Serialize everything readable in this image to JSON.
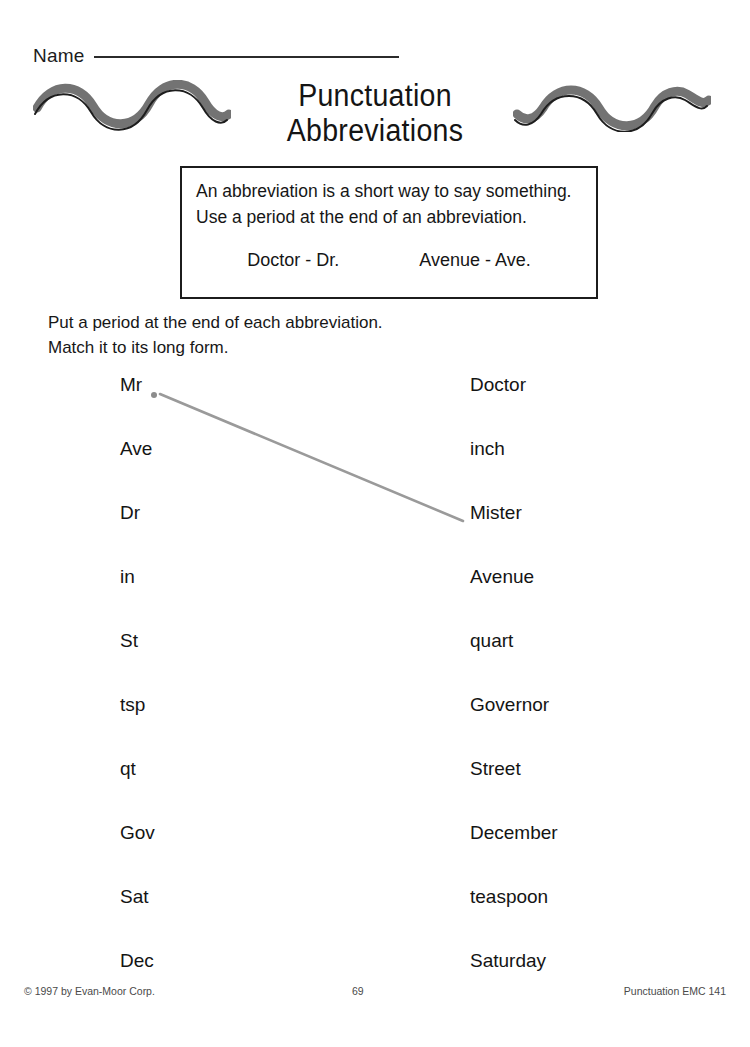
{
  "worksheet": {
    "name_label": "Name",
    "title_line_1": "Punctuation",
    "title_line_2": "Abbreviations",
    "rule_line_1": "An abbreviation is a short way to say something.",
    "rule_line_2": "Use a period at the end of an abbreviation.",
    "example_1": "Doctor - Dr.",
    "example_2": "Avenue - Ave.",
    "direction_line_1": "Put a period at the end of each abbreviation.",
    "direction_line_2": "Match it to its long form."
  },
  "matching": {
    "abbreviations": [
      "Mr",
      "Ave",
      "Dr",
      "in",
      "St",
      "tsp",
      "qt",
      "Gov",
      "Sat",
      "Dec"
    ],
    "long_forms": [
      "Doctor",
      "inch",
      "Mister",
      "Avenue",
      "quart",
      "Governor",
      "Street",
      "December",
      "teaspoon",
      "Saturday"
    ],
    "student_marks": {
      "period_after": "Mr",
      "drawn_line_from": "Mr",
      "drawn_line_to": "Mister",
      "line_color": "#9a9a9a",
      "period_color": "#8c8c8c"
    }
  },
  "footer": {
    "copyright": "© 1997 by Evan-Moor Corp.",
    "page_number": "69",
    "code": "Punctuation EMC 141"
  },
  "decoration": {
    "wave_left": "wave-squiggle-icon",
    "wave_right": "wave-squiggle-icon",
    "wave_band_color": "#5a5a5a",
    "wave_line_color": "#1d1d1d"
  }
}
